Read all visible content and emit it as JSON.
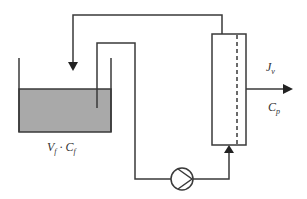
{
  "diagram": {
    "type": "process-flow",
    "colors": {
      "line": "#3a3a3a",
      "liquid": "#a9a9a9",
      "background": "#ffffff"
    },
    "labels": {
      "tank": {
        "main1": "V",
        "sub1": "f",
        "sep": " · ",
        "main2": "C",
        "sub2": "f"
      },
      "flux": {
        "main": "J",
        "sub": "v"
      },
      "permeate": {
        "main": "C",
        "sub": "p"
      }
    },
    "components": [
      "feed-tank",
      "pump",
      "membrane-module",
      "retentate-return-line",
      "permeate-outlet"
    ]
  }
}
